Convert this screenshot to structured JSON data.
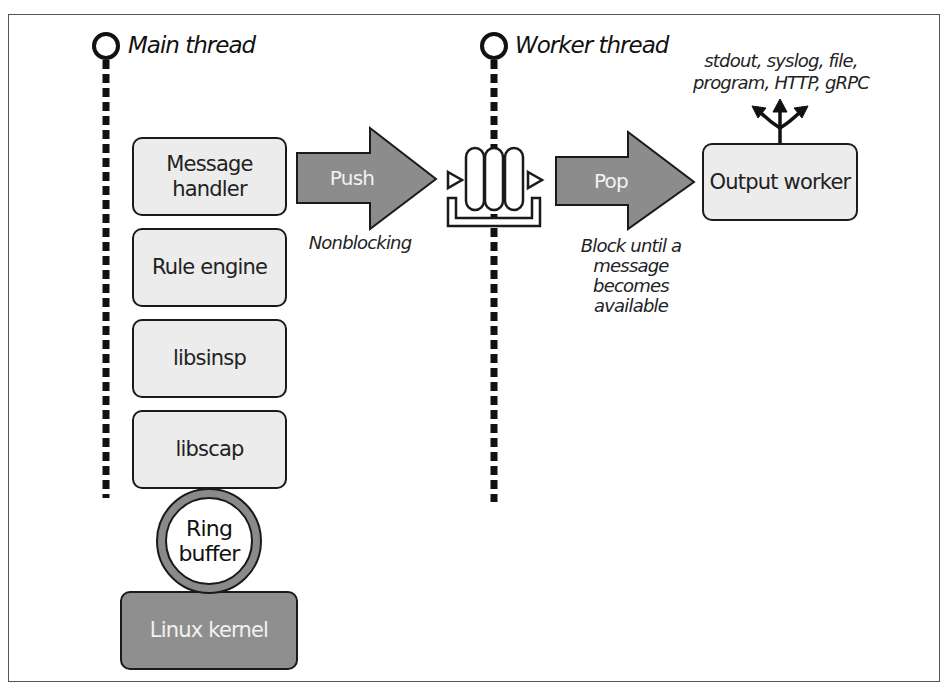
{
  "threads": {
    "main": "Main thread",
    "worker": "Worker thread"
  },
  "main_stack": [
    {
      "label": "Message handler",
      "line1": "Message",
      "line2": "handler"
    },
    {
      "label": "Rule engine"
    },
    {
      "label": "libsinsp"
    },
    {
      "label": "libscap"
    }
  ],
  "ring_buffer": {
    "line1": "Ring",
    "line2": "buffer"
  },
  "kernel": {
    "label": "Linux kernel"
  },
  "push": {
    "label": "Push",
    "caption": "Nonblocking"
  },
  "pop": {
    "label": "Pop",
    "caption_line1": "Block until a",
    "caption_line2": "message becomes",
    "caption_line3": "available"
  },
  "output_worker": {
    "label": "Output worker"
  },
  "outputs": {
    "line1": "stdout, syslog, file,",
    "line2": "program, HTTP, gRPC"
  },
  "colors": {
    "box_fill": "#ececec",
    "arrow_fill": "#8c8c8c",
    "kernel_fill": "#8f8f8f",
    "ring_stroke": "#8a8a8a",
    "stroke": "#1a1a1a"
  }
}
